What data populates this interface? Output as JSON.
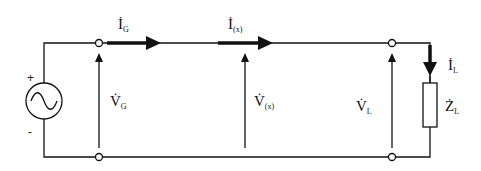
{
  "diagram": {
    "type": "transmission-line-circuit",
    "source": {
      "plus": "+",
      "minus": "-",
      "icon": "ac-source-icon"
    },
    "labels": {
      "i_g": {
        "main": "İ",
        "sub": "G"
      },
      "i_x": {
        "main": "İ",
        "sub": "(x)"
      },
      "i_l": {
        "main": "İ",
        "sub": "L"
      },
      "v_g": {
        "main": "V̇",
        "sub": "G"
      },
      "v_x": {
        "main": "V̇",
        "sub": "(x)"
      },
      "v_l": {
        "main": "V̇",
        "sub": "L"
      },
      "z_l": {
        "main": "Ż",
        "sub": "L"
      }
    },
    "colors": {
      "line": "#111111",
      "background": "#ffffff"
    }
  }
}
